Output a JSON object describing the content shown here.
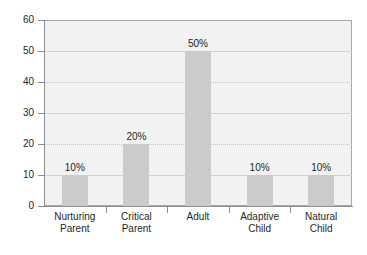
{
  "chart_data": {
    "type": "bar",
    "title": "",
    "subtitle": "",
    "xlabel": "",
    "ylabel": "",
    "categories": [
      "Nurturing Parent",
      "Critical Parent",
      "Adult",
      "Adaptive Child",
      "Natural Child"
    ],
    "category_lines": [
      [
        "Nurturing",
        "Parent"
      ],
      [
        "Critical",
        "Parent"
      ],
      [
        "Adult",
        ""
      ],
      [
        "Adaptive",
        "Child"
      ],
      [
        "Natural",
        "Child"
      ]
    ],
    "values": [
      10,
      20,
      50,
      10,
      10
    ],
    "data_labels": [
      "10%",
      "20%",
      "50%",
      "10%",
      "10%"
    ],
    "ylim": [
      0,
      60
    ],
    "yticks": [
      0,
      10,
      20,
      30,
      40,
      50,
      60
    ],
    "ytick_labels": [
      "0",
      "10",
      "20",
      "30",
      "40",
      "50",
      "60"
    ],
    "grid": true,
    "grid_axis": "y",
    "legend": false,
    "legend_position": "none",
    "colors": {
      "bar_fill": "#cbcbcb",
      "plot_background": "#f2f2f2",
      "page_background": "#ffffff",
      "axis_line": "#8c8c8c",
      "grid_line": "#d2d2d2",
      "text": "#1f1f1f",
      "plot_border": "#a8a8a8"
    }
  }
}
